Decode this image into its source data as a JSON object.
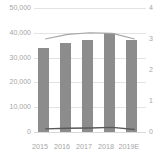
{
  "chart_data": {
    "type": "bar",
    "title": "",
    "xlabel": "",
    "ylabel": "",
    "categories": [
      "2015",
      "2016",
      "2017",
      "2018",
      "2019E"
    ],
    "series": [
      {
        "name": "bars",
        "type": "bar",
        "axis": "left",
        "values": [
          34000,
          36000,
          37000,
          40000,
          37000
        ],
        "color": "#8c8c8c"
      },
      {
        "name": "line-upper",
        "type": "line",
        "axis": "right",
        "values": [
          3.0,
          3.15,
          3.2,
          3.18,
          3.0
        ],
        "color": "#a6a6a6"
      },
      {
        "name": "line-lower",
        "type": "line",
        "axis": "right",
        "values": [
          0.1,
          0.12,
          0.13,
          0.15,
          0.08
        ],
        "color": "#595959"
      }
    ],
    "left_axis": {
      "ticks": [
        "0",
        "10,000",
        "20,000",
        "30,000",
        "40,000",
        "50,000"
      ],
      "values": [
        0,
        10000,
        20000,
        30000,
        40000,
        50000
      ],
      "ylim": [
        0,
        50000
      ]
    },
    "right_axis": {
      "ticks": [
        "0",
        "1",
        "2",
        "3",
        "4"
      ],
      "values": [
        0,
        1,
        2,
        3,
        4
      ],
      "ylim": [
        0,
        4
      ]
    },
    "grid": true,
    "legend": "none",
    "colors": {
      "bar": "#8c8c8c",
      "line_upper": "#a6a6a6",
      "line_lower": "#595959",
      "grid": "#e3e3e3",
      "tick_text": "#a6a6a6",
      "background": "#ffffff"
    }
  },
  "axes": {
    "left": {
      "t5": "50,000",
      "t4": "40,000",
      "t3": "30,000",
      "t2": "20,000",
      "t1": "10,000",
      "t0": "0"
    },
    "right": {
      "t4": "4",
      "t3": "3",
      "t2": "2",
      "t1": "1",
      "t0": "0"
    },
    "x": {
      "c0": "2015",
      "c1": "2016",
      "c2": "2017",
      "c3": "2018",
      "c4": "2019E"
    }
  }
}
